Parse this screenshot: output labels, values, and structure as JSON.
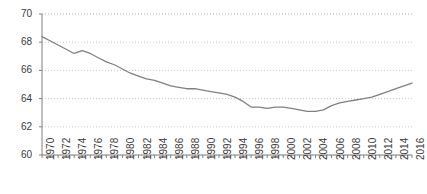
{
  "chart_data": {
    "type": "line",
    "title": "",
    "subtitle": "",
    "xlabel": "",
    "ylabel": "",
    "xlim": [
      1970,
      2016
    ],
    "ylim": [
      60,
      70
    ],
    "yticks": [
      60,
      62,
      64,
      66,
      68,
      70
    ],
    "xticks": [
      1970,
      1972,
      1974,
      1976,
      1978,
      1980,
      1982,
      1984,
      1986,
      1988,
      1990,
      1992,
      1994,
      1996,
      1998,
      2000,
      2002,
      2004,
      2006,
      2008,
      2010,
      2012,
      2014,
      2016
    ],
    "grid": true,
    "grid_style": "dotted-horizontal",
    "legend": "none",
    "line_color": "#808080",
    "grid_color": "#c8c8c8",
    "axis_color": "#808080",
    "tick_label_color": "#3a3a3a",
    "x": [
      1970,
      1971,
      1972,
      1973,
      1974,
      1975,
      1976,
      1977,
      1978,
      1979,
      1980,
      1981,
      1982,
      1983,
      1984,
      1985,
      1986,
      1987,
      1988,
      1989,
      1990,
      1991,
      1992,
      1993,
      1994,
      1995,
      1996,
      1997,
      1998,
      1999,
      2000,
      2001,
      2002,
      2003,
      2004,
      2005,
      2006,
      2007,
      2008,
      2009,
      2010,
      2011,
      2012,
      2013,
      2014,
      2015,
      2016
    ],
    "series": [
      {
        "name": "value",
        "values": [
          68.4,
          68.1,
          67.8,
          67.5,
          67.2,
          67.4,
          67.2,
          66.9,
          66.6,
          66.4,
          66.1,
          65.8,
          65.6,
          65.4,
          65.3,
          65.1,
          64.9,
          64.8,
          64.7,
          64.7,
          64.6,
          64.5,
          64.4,
          64.3,
          64.1,
          63.8,
          63.4,
          63.4,
          63.3,
          63.4,
          63.4,
          63.3,
          63.2,
          63.1,
          63.1,
          63.2,
          63.5,
          63.7,
          63.8,
          63.9,
          64.0,
          64.1,
          64.3,
          64.5,
          64.7,
          64.9,
          65.1
        ]
      }
    ]
  }
}
